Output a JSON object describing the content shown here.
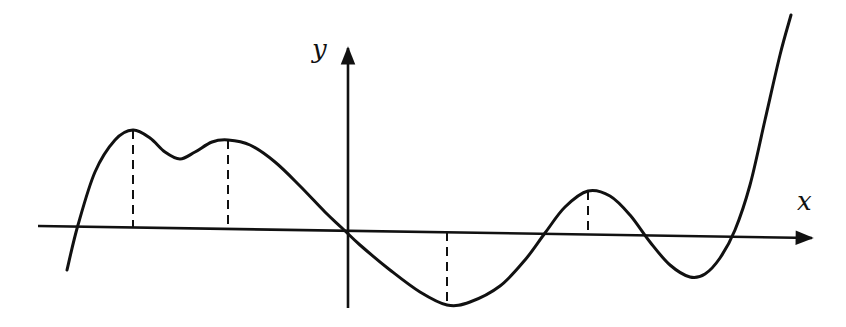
{
  "diagram": {
    "type": "function-graph",
    "axes": {
      "x_label": "x",
      "y_label": "y",
      "origin_px": [
        348,
        232
      ],
      "x_axis": {
        "from": [
          38,
          226
        ],
        "to": [
          812,
          238
        ]
      },
      "y_axis": {
        "from": [
          348,
          308
        ],
        "to": [
          348,
          48
        ]
      }
    },
    "curve_points_px": [
      [
        67,
        270
      ],
      [
        78,
        225
      ],
      [
        95,
        172
      ],
      [
        115,
        140
      ],
      [
        133,
        130
      ],
      [
        150,
        138
      ],
      [
        165,
        152
      ],
      [
        180,
        159
      ],
      [
        195,
        152
      ],
      [
        212,
        142
      ],
      [
        228,
        140
      ],
      [
        250,
        145
      ],
      [
        275,
        162
      ],
      [
        300,
        186
      ],
      [
        325,
        212
      ],
      [
        342,
        228
      ],
      [
        360,
        245
      ],
      [
        390,
        270
      ],
      [
        420,
        292
      ],
      [
        447,
        305
      ],
      [
        470,
        302
      ],
      [
        500,
        286
      ],
      [
        525,
        260
      ],
      [
        545,
        233
      ],
      [
        565,
        207
      ],
      [
        588,
        191
      ],
      [
        610,
        196
      ],
      [
        630,
        215
      ],
      [
        650,
        242
      ],
      [
        670,
        265
      ],
      [
        690,
        277
      ],
      [
        705,
        274
      ],
      [
        720,
        258
      ],
      [
        735,
        230
      ],
      [
        750,
        185
      ],
      [
        765,
        120
      ],
      [
        780,
        55
      ],
      [
        791,
        15
      ]
    ],
    "extrema_markers": [
      {
        "kind": "local-max",
        "x_px": 133,
        "y_top_px": 130,
        "y_axis_px": 228
      },
      {
        "kind": "local-max",
        "x_px": 228,
        "y_top_px": 140,
        "y_axis_px": 229
      },
      {
        "kind": "local-min",
        "x_px": 447,
        "y_top_px": 232,
        "y_axis_px": 305
      },
      {
        "kind": "local-max",
        "x_px": 588,
        "y_top_px": 191,
        "y_axis_px": 234
      }
    ],
    "colors": {
      "ink": "#111111",
      "background": "#ffffff"
    }
  }
}
